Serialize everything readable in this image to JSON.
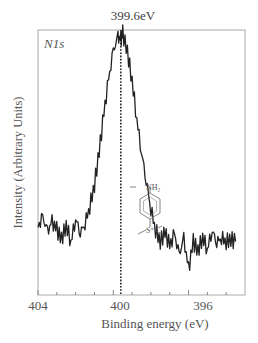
{
  "chart_data": {
    "type": "line",
    "title": "",
    "panel_label": "N1s",
    "annotation": {
      "text": "399.6eV",
      "x": 399.6,
      "style": "dotted vertical line"
    },
    "xlabel": "Binding energy (eV)",
    "ylabel": "Intensity (Arbitrary Units)",
    "xlim": [
      404,
      393
    ],
    "x_reversed": true,
    "xticks": [
      404,
      400,
      396
    ],
    "xtick_labels": [
      "404",
      "400",
      "396"
    ],
    "minor_xticks": [
      403,
      402,
      401,
      399,
      398,
      397,
      395,
      394
    ],
    "yticks": [],
    "grid": false,
    "legend": null,
    "inset": {
      "type": "chemical-structure",
      "description": "para-substituted benzene: NH2 at top, S(CH3)2 (sulfonium) at bottom",
      "labels": [
        "NH2",
        "S"
      ]
    },
    "series": [
      {
        "name": "N1s spectrum",
        "x": [
          404.0,
          403.75,
          403.5,
          403.25,
          403.0,
          402.75,
          402.5,
          402.25,
          402.0,
          401.75,
          401.5,
          401.25,
          401.0,
          400.75,
          400.5,
          400.25,
          400.0,
          399.75,
          399.6,
          399.5,
          399.25,
          399.0,
          398.75,
          398.5,
          398.25,
          398.0,
          397.75,
          397.5,
          397.25,
          397.0,
          396.75,
          396.5,
          396.25,
          396.0,
          395.75,
          395.5,
          395.25,
          395.0,
          394.75,
          394.5,
          394.25,
          394.0,
          393.75,
          393.5
        ],
        "y": [
          0.18,
          0.22,
          0.16,
          0.2,
          0.17,
          0.13,
          0.19,
          0.12,
          0.22,
          0.16,
          0.2,
          0.27,
          0.36,
          0.5,
          0.66,
          0.8,
          0.92,
          0.98,
          0.97,
          1.0,
          0.92,
          0.8,
          0.64,
          0.5,
          0.38,
          0.26,
          0.17,
          0.12,
          0.16,
          0.1,
          0.15,
          0.06,
          0.13,
          0.0,
          0.12,
          0.08,
          0.14,
          0.09,
          0.17,
          0.12,
          0.14,
          0.12,
          0.13,
          0.12
        ]
      }
    ]
  }
}
